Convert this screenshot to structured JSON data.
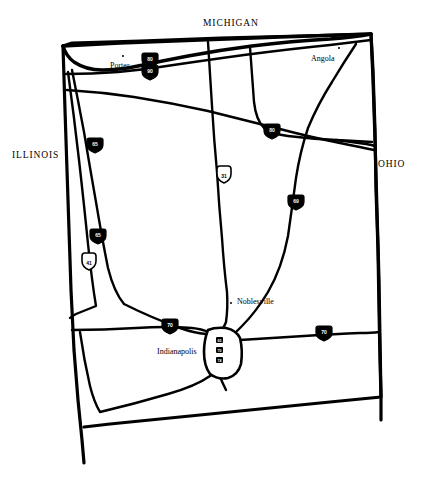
{
  "map": {
    "title": "Indiana Interstate Highway Sketch Map",
    "background_color": "#ffffff",
    "ink_color": "#000000",
    "width": 422,
    "height": 480
  },
  "state_labels": [
    {
      "name": "MICHIGAN",
      "text": "MICHIGAN",
      "x": 203,
      "y": 24
    },
    {
      "name": "ILLINOIS",
      "text": "ILLINOIS",
      "x": 12,
      "y": 150
    },
    {
      "name": "OHIO",
      "text": "OHIO",
      "x": 378,
      "y": 160
    }
  ],
  "cities": [
    {
      "name": "Porter",
      "text": "Porter",
      "label_x": 110,
      "label_y": 64,
      "dot_x": 122,
      "dot_y": 55
    },
    {
      "name": "Angola",
      "text": "Angola",
      "label_x": 311,
      "label_y": 57,
      "dot_x": 338,
      "dot_y": 48
    },
    {
      "name": "Noblesville",
      "text": "Noblesville",
      "label_x": 238,
      "label_y": 298,
      "dot_x": 231,
      "dot_y": 302
    },
    {
      "name": "Indianapolis",
      "text": "Indianapolis",
      "label_x": 158,
      "label_y": 350,
      "dot_x": 0,
      "dot_y": 0
    }
  ],
  "shields": [
    {
      "name": "toll-road-i80",
      "type": "interstate",
      "number": "80",
      "x": 150,
      "y": 60
    },
    {
      "name": "toll-road-i90",
      "type": "interstate",
      "number": "90",
      "x": 150,
      "y": 72
    },
    {
      "name": "i80-east",
      "type": "interstate",
      "number": "80",
      "x": 272,
      "y": 131
    },
    {
      "name": "i65-north",
      "type": "interstate",
      "number": "65",
      "x": 95,
      "y": 145
    },
    {
      "name": "us31-north",
      "type": "us",
      "number": "31",
      "x": 224,
      "y": 176
    },
    {
      "name": "i69-east",
      "type": "interstate",
      "number": "69",
      "x": 296,
      "y": 202
    },
    {
      "name": "i65-southwest",
      "type": "interstate",
      "number": "65",
      "x": 98,
      "y": 236
    },
    {
      "name": "us41-southwest",
      "type": "us",
      "number": "41",
      "x": 89,
      "y": 263
    },
    {
      "name": "i70-west",
      "type": "interstate",
      "number": "70",
      "x": 170,
      "y": 326
    },
    {
      "name": "i70-east",
      "type": "interstate",
      "number": "70",
      "x": 324,
      "y": 333
    },
    {
      "name": "indy-loop-1",
      "type": "interstate",
      "number": "65",
      "x": 219,
      "y": 340
    },
    {
      "name": "indy-loop-2",
      "type": "interstate",
      "number": "70",
      "x": 219,
      "y": 350
    },
    {
      "name": "indy-loop-3",
      "type": "interstate",
      "number": "74",
      "x": 219,
      "y": 360
    }
  ],
  "geometry": {
    "state_outline": "M 63 46 L 72 43 L 140 41 L 220 38 L 300 36 L 371 34 L 373 60 L 374 110 L 375 170 L 376 230 L 377 290 L 378 330 L 379 360 L 380 396 L 300 406 L 220 414 L 150 420 L 95 425 L 82 427 L 78 400 L 75 360 L 72 300 L 70 240 L 67 170 L 65 110 Z",
    "west_border_extension": "M 63 46 L 65 110 L 67 170 L 70 240 L 72 300 L 75 360 L 78 400 L 82 427 L 84 462",
    "east_border_extension": "M 371 34 L 373 60 L 375 170 L 377 290 L 379 360 L 380 396",
    "lake_michigan_shore": "M 63 46 Q 70 58 84 62 Q 104 68 124 64 Q 150 60 172 56 Q 210 49 250 46 Q 300 42 340 40 Q 360 39 371 34",
    "toll_road": "M 66 70 Q 100 70 132 68 Q 170 64 210 58 Q 260 52 310 47 Q 345 44 371 40",
    "us30_route": "M 67 88 Q 110 90 150 96 Q 200 102 240 110 Q 280 120 310 128 Q 340 136 362 143",
    "i65_route": "M 71 70 Q 82 110 90 150 Q 98 195 104 235 Q 110 272 118 300 Q 150 320 196 338",
    "us41_route": "M 68 70 Q 76 120 82 175 Q 88 225 92 262 Q 96 295 100 312 Q 76 318 70 322",
    "us31_route": "M 210 42 Q 212 80 214 120 Q 217 165 220 205 Q 223 250 226 290 Q 228 312 226 326",
    "i69_route": "M 360 40 Q 340 70 320 100 Q 305 130 296 165 Q 290 200 284 240 Q 276 280 258 306 Q 246 320 236 330",
    "i70_west_route": "M 72 342 Q 110 336 150 330 Q 180 326 206 330",
    "i70_east_route": "M 240 338 Q 280 336 320 334 Q 350 332 378 331",
    "south_route": "M 84 345 Q 90 378 98 404 Q 130 400 170 390 Q 200 382 212 372",
    "i80_spur": "M 250 48 Q 252 80 254 110 Q 256 124 272 131 Q 300 136 330 138",
    "indy_beltway": "M 206 330 Q 204 346 206 362 Q 210 374 224 376 Q 238 374 240 360 Q 242 344 238 332 Q 226 326 206 330"
  }
}
